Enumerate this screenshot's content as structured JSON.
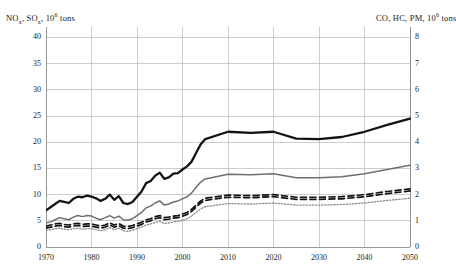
{
  "chart_data": {
    "type": "line",
    "title": "",
    "xlabel": "",
    "ylabel": "NOx, SOx, 10^6 tons",
    "ylabel_left": "NOx, SOx, 10⁶ tons",
    "ylabel_right": "CO, HC, PM, 10⁶ tons",
    "grid": true,
    "legend_position": "none",
    "xlim": [
      1970,
      2050
    ],
    "xticks": [
      1970,
      1980,
      1990,
      2000,
      2010,
      2020,
      2030,
      2040,
      2050
    ],
    "xtick_labels": [
      "1970",
      "1980",
      "1990",
      "2000",
      "2010",
      "2020",
      "2030",
      "2040",
      "2050"
    ],
    "ylim_left": [
      0,
      42
    ],
    "yticks_left": [
      0,
      5,
      10,
      15,
      20,
      25,
      30,
      35,
      40
    ],
    "ytick_labels_left": [
      "0",
      "5",
      "10",
      "15",
      "20",
      "25",
      "30",
      "35",
      "40"
    ],
    "ylim_right": [
      0,
      8.4
    ],
    "yticks_right": [
      0,
      1,
      2,
      3,
      4,
      5,
      6,
      7,
      8
    ],
    "ytick_labels_right": [
      "0",
      "1",
      "2",
      "3",
      "4",
      "5",
      "6",
      "7",
      "8"
    ],
    "x": [
      1970,
      1971,
      1972,
      1973,
      1974,
      1975,
      1976,
      1977,
      1978,
      1979,
      1980,
      1981,
      1982,
      1983,
      1984,
      1985,
      1986,
      1987,
      1988,
      1989,
      1990,
      1991,
      1992,
      1993,
      1994,
      1995,
      1996,
      1997,
      1998,
      1999,
      2000,
      2001,
      2002,
      2003,
      2004,
      2005,
      2010,
      2015,
      2020,
      2025,
      2030,
      2035,
      2040,
      2045,
      2050
    ],
    "series": [
      {
        "name": "series-1-thick-black",
        "axis": "left",
        "style": "solid",
        "color": "#141414",
        "width": 2.3,
        "values": [
          7.0,
          7.6,
          8.2,
          8.8,
          8.6,
          8.4,
          9.2,
          9.6,
          9.5,
          9.8,
          9.6,
          9.3,
          8.8,
          9.2,
          10.0,
          9.0,
          9.7,
          8.4,
          8.2,
          8.6,
          9.6,
          10.6,
          12.2,
          12.6,
          13.6,
          14.2,
          13.0,
          13.3,
          14.0,
          14.1,
          14.8,
          15.4,
          16.3,
          18.0,
          19.6,
          20.6,
          22.0,
          21.8,
          22.0,
          20.7,
          20.6,
          21.0,
          22.0,
          23.3,
          24.5
        ]
      },
      {
        "name": "series-1b-projection-thick-black",
        "axis": "left",
        "style": "solid",
        "color": "#141414",
        "width": 2.3,
        "note": "linear projection 2005-2050 from 20.6 to 41.0"
      },
      {
        "name": "series-2-gray-solid",
        "axis": "left",
        "style": "solid",
        "color": "#6e6e6e",
        "width": 1.5,
        "values": [
          4.6,
          4.8,
          5.2,
          5.6,
          5.4,
          5.2,
          5.7,
          6.0,
          5.8,
          6.0,
          5.9,
          5.5,
          5.2,
          5.6,
          6.0,
          5.5,
          5.9,
          5.2,
          5.1,
          5.4,
          6.0,
          6.6,
          7.5,
          7.8,
          8.4,
          8.8,
          8.0,
          8.2,
          8.6,
          8.8,
          9.2,
          9.6,
          10.3,
          11.4,
          12.4,
          13.0,
          13.9,
          13.8,
          14.0,
          13.2,
          13.2,
          13.4,
          14.0,
          14.8,
          15.6
        ]
      },
      {
        "name": "series-3-dashed-upper",
        "axis": "left",
        "style": "dashed",
        "color": "#141414",
        "width": 1.7,
        "values": [
          4.0,
          4.2,
          4.4,
          4.5,
          4.3,
          4.2,
          4.4,
          4.5,
          4.3,
          4.4,
          4.4,
          4.2,
          4.0,
          4.2,
          4.6,
          4.2,
          4.5,
          4.0,
          3.9,
          4.1,
          4.4,
          4.7,
          5.2,
          5.4,
          5.8,
          6.0,
          5.6,
          5.7,
          5.9,
          6.0,
          6.3,
          6.6,
          7.2,
          8.0,
          8.8,
          9.3,
          9.9,
          9.8,
          10.0,
          9.5,
          9.5,
          9.6,
          10.0,
          10.6,
          11.1
        ]
      },
      {
        "name": "series-4-dashed-lower",
        "axis": "left",
        "style": "dashed",
        "color": "#141414",
        "width": 1.7,
        "values": [
          3.6,
          3.8,
          4.0,
          4.1,
          3.9,
          3.8,
          4.0,
          4.1,
          3.9,
          4.0,
          4.0,
          3.8,
          3.6,
          3.8,
          4.2,
          3.8,
          4.1,
          3.6,
          3.5,
          3.7,
          4.0,
          4.3,
          4.8,
          5.0,
          5.4,
          5.6,
          5.2,
          5.3,
          5.5,
          5.6,
          5.9,
          6.2,
          6.8,
          7.6,
          8.4,
          8.9,
          9.5,
          9.4,
          9.6,
          9.1,
          9.1,
          9.2,
          9.6,
          10.2,
          10.7
        ]
      },
      {
        "name": "series-5-gray-dotted",
        "axis": "left",
        "style": "dotted",
        "color": "#8a8a8a",
        "width": 1.3,
        "values": [
          3.2,
          3.3,
          3.5,
          3.6,
          3.4,
          3.3,
          3.5,
          3.6,
          3.4,
          3.5,
          3.5,
          3.3,
          3.1,
          3.3,
          3.7,
          3.3,
          3.6,
          3.1,
          3.0,
          3.2,
          3.5,
          3.8,
          4.2,
          4.4,
          4.7,
          4.9,
          4.5,
          4.6,
          4.8,
          4.9,
          5.1,
          5.4,
          5.9,
          6.6,
          7.3,
          7.7,
          8.3,
          8.2,
          8.4,
          8.0,
          8.0,
          8.1,
          8.4,
          8.9,
          9.3
        ]
      }
    ],
    "endpoints_2050": {
      "thick_black_left_scale": 41.0,
      "gray_solid_left_scale": 26.0,
      "dashed_upper_left_scale": 19.5,
      "dashed_lower_left_scale": 18.9,
      "gray_dotted_left_scale": 15.8
    }
  },
  "colors": {
    "grid": "#b8b8b8",
    "axis": "#8c8c8c",
    "black_line": "#141414",
    "gray_line": "#6e6e6e",
    "dotted_line": "#8a8a8a",
    "background": "#ffffff"
  }
}
